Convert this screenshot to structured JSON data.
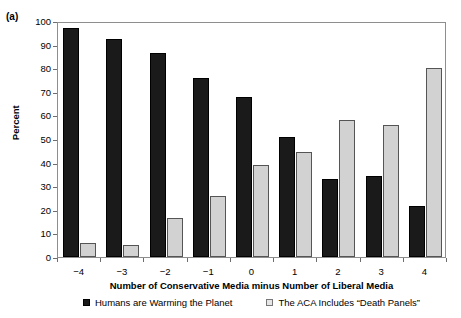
{
  "panel": {
    "label": "(a)"
  },
  "chart_data": {
    "type": "bar",
    "title": "",
    "panel_label": "(a)",
    "xlabel": "Number of Conservative Media minus Number of Liberal Media",
    "ylabel": "Percent",
    "ylim": [
      0,
      100
    ],
    "ytick_step": 10,
    "yticks": [
      0,
      10,
      20,
      30,
      40,
      50,
      60,
      70,
      80,
      90,
      100
    ],
    "grid": false,
    "legend_position": "bottom",
    "categories": [
      "−4",
      "−3",
      "−2",
      "−1",
      "0",
      "1",
      "2",
      "3",
      "4"
    ],
    "series": [
      {
        "name": "Humans are Warming the Planet",
        "color": "#1a1a1a",
        "values": [
          97,
          92.5,
          86.5,
          76,
          68,
          51,
          33,
          34.5,
          21.5
        ]
      },
      {
        "name": "The ACA Includes “Death Panels”",
        "color": "#d2d2d2",
        "values": [
          6,
          5,
          16.5,
          26,
          39,
          44.5,
          58,
          56,
          80
        ]
      }
    ]
  }
}
